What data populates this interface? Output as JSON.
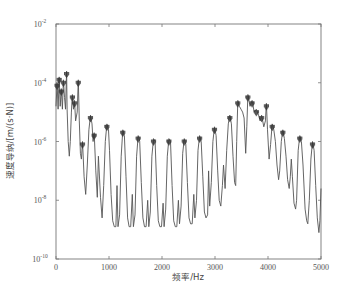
{
  "chart_data": {
    "type": "line",
    "title": "",
    "xlabel": "频率/Hz",
    "ylabel": "速度导纳/[m/(s·N)]",
    "xlim": [
      0,
      5000
    ],
    "ylim": [
      1e-10,
      0.01
    ],
    "yscale": "log",
    "grid": false,
    "legend": null,
    "x_ticks": [
      0,
      1000,
      2000,
      3000,
      4000,
      5000
    ],
    "x_tick_labels": [
      "0",
      "1000",
      "2000",
      "3000",
      "4000",
      "5000"
    ],
    "y_ticks": [
      1e-10,
      1e-08,
      1e-06,
      0.0001,
      0.01
    ],
    "y_tick_labels": [
      {
        "base": "10",
        "exp": "-10"
      },
      {
        "base": "10",
        "exp": "-8"
      },
      {
        "base": "10",
        "exp": "-6"
      },
      {
        "base": "10",
        "exp": "-4"
      },
      {
        "base": "10",
        "exp": "-2"
      }
    ],
    "series": [
      {
        "name": "velocity admittance",
        "color": "#555555",
        "log10_points": [
          [
            0,
            -4.8
          ],
          [
            20,
            -4.0
          ],
          [
            40,
            -4.9
          ],
          [
            60,
            -3.8
          ],
          [
            80,
            -4.8
          ],
          [
            100,
            -4.2
          ],
          [
            120,
            -4.9
          ],
          [
            140,
            -3.9
          ],
          [
            160,
            -4.5
          ],
          [
            180,
            -4.9
          ],
          [
            200,
            -3.6
          ],
          [
            210,
            -4.9
          ],
          [
            230,
            -6.0
          ],
          [
            250,
            -6.5
          ],
          [
            270,
            -6.0
          ],
          [
            290,
            -5.0
          ],
          [
            310,
            -4.4
          ],
          [
            330,
            -4.9
          ],
          [
            350,
            -4.6
          ],
          [
            370,
            -5.3
          ],
          [
            400,
            -5.0
          ],
          [
            420,
            -3.9
          ],
          [
            440,
            -5.3
          ],
          [
            460,
            -6.4
          ],
          [
            480,
            -6.6
          ],
          [
            500,
            -6.0
          ],
          [
            530,
            -7.2
          ],
          [
            560,
            -7.8
          ],
          [
            590,
            -6.8
          ],
          [
            620,
            -5.6
          ],
          [
            650,
            -5.1
          ],
          [
            680,
            -5.4
          ],
          [
            700,
            -6.0
          ],
          [
            720,
            -5.7
          ],
          [
            750,
            -7.0
          ],
          [
            780,
            -7.9
          ],
          [
            800,
            -6.5
          ],
          [
            840,
            -7.9
          ],
          [
            870,
            -8.6
          ],
          [
            900,
            -7.5
          ],
          [
            930,
            -6.0
          ],
          [
            960,
            -5.4
          ],
          [
            990,
            -5.6
          ],
          [
            1010,
            -6.3
          ],
          [
            1040,
            -7.8
          ],
          [
            1070,
            -8.7
          ],
          [
            1100,
            -8.9
          ],
          [
            1130,
            -8.9
          ],
          [
            1150,
            -7.5
          ],
          [
            1170,
            -8.9
          ],
          [
            1200,
            -8.5
          ],
          [
            1230,
            -6.5
          ],
          [
            1260,
            -5.6
          ],
          [
            1290,
            -5.8
          ],
          [
            1320,
            -7.2
          ],
          [
            1350,
            -8.6
          ],
          [
            1380,
            -8.9
          ],
          [
            1410,
            -8.9
          ],
          [
            1440,
            -7.8
          ],
          [
            1460,
            -8.9
          ],
          [
            1490,
            -8.5
          ],
          [
            1520,
            -6.5
          ],
          [
            1550,
            -5.8
          ],
          [
            1580,
            -6.0
          ],
          [
            1610,
            -7.4
          ],
          [
            1640,
            -8.6
          ],
          [
            1670,
            -8.9
          ],
          [
            1700,
            -8.9
          ],
          [
            1730,
            -8.0
          ],
          [
            1750,
            -8.9
          ],
          [
            1780,
            -8.4
          ],
          [
            1810,
            -6.5
          ],
          [
            1840,
            -5.9
          ],
          [
            1870,
            -6.0
          ],
          [
            1900,
            -7.5
          ],
          [
            1930,
            -8.7
          ],
          [
            1960,
            -8.9
          ],
          [
            1990,
            -8.9
          ],
          [
            2020,
            -8.1
          ],
          [
            2040,
            -8.9
          ],
          [
            2070,
            -8.3
          ],
          [
            2100,
            -6.5
          ],
          [
            2130,
            -5.9
          ],
          [
            2160,
            -6.0
          ],
          [
            2190,
            -7.5
          ],
          [
            2220,
            -8.7
          ],
          [
            2250,
            -8.9
          ],
          [
            2280,
            -8.9
          ],
          [
            2310,
            -8.0
          ],
          [
            2330,
            -8.8
          ],
          [
            2360,
            -8.2
          ],
          [
            2390,
            -6.4
          ],
          [
            2420,
            -5.9
          ],
          [
            2450,
            -6.1
          ],
          [
            2480,
            -7.4
          ],
          [
            2510,
            -8.6
          ],
          [
            2540,
            -8.8
          ],
          [
            2570,
            -8.8
          ],
          [
            2600,
            -7.8
          ],
          [
            2620,
            -8.6
          ],
          [
            2650,
            -8.0
          ],
          [
            2680,
            -6.3
          ],
          [
            2710,
            -5.8
          ],
          [
            2740,
            -6.0
          ],
          [
            2770,
            -7.2
          ],
          [
            2800,
            -8.4
          ],
          [
            2830,
            -8.6
          ],
          [
            2860,
            -8.5
          ],
          [
            2880,
            -7.0
          ],
          [
            2900,
            -8.2
          ],
          [
            2930,
            -7.4
          ],
          [
            2960,
            -6.0
          ],
          [
            2990,
            -5.5
          ],
          [
            3020,
            -5.8
          ],
          [
            3050,
            -7.0
          ],
          [
            3080,
            -8.0
          ],
          [
            3110,
            -8.2
          ],
          [
            3140,
            -7.5
          ],
          [
            3160,
            -6.8
          ],
          [
            3190,
            -7.6
          ],
          [
            3220,
            -6.3
          ],
          [
            3250,
            -5.4
          ],
          [
            3280,
            -5.1
          ],
          [
            3310,
            -5.4
          ],
          [
            3340,
            -6.5
          ],
          [
            3370,
            -7.4
          ],
          [
            3390,
            -7.5
          ],
          [
            3410,
            -6.0
          ],
          [
            3430,
            -4.6
          ],
          [
            3460,
            -4.8
          ],
          [
            3490,
            -4.9
          ],
          [
            3520,
            -5.0
          ],
          [
            3550,
            -5.2
          ],
          [
            3580,
            -6.4
          ],
          [
            3600,
            -5.5
          ],
          [
            3620,
            -4.4
          ],
          [
            3660,
            -4.8
          ],
          [
            3700,
            -4.6
          ],
          [
            3740,
            -5.0
          ],
          [
            3780,
            -4.9
          ],
          [
            3820,
            -5.1
          ],
          [
            3850,
            -5.3
          ],
          [
            3880,
            -5.1
          ],
          [
            3920,
            -5.5
          ],
          [
            3950,
            -5.3
          ],
          [
            3970,
            -4.7
          ],
          [
            3990,
            -5.6
          ],
          [
            4020,
            -6.6
          ],
          [
            4050,
            -6.1
          ],
          [
            4080,
            -5.4
          ],
          [
            4110,
            -5.6
          ],
          [
            4140,
            -6.0
          ],
          [
            4170,
            -6.8
          ],
          [
            4200,
            -7.3
          ],
          [
            4220,
            -7.0
          ],
          [
            4250,
            -6.0
          ],
          [
            4280,
            -5.6
          ],
          [
            4310,
            -5.9
          ],
          [
            4340,
            -6.5
          ],
          [
            4370,
            -7.3
          ],
          [
            4400,
            -7.6
          ],
          [
            4420,
            -7.2
          ],
          [
            4440,
            -6.6
          ],
          [
            4460,
            -7.2
          ],
          [
            4490,
            -8.1
          ],
          [
            4520,
            -8.3
          ],
          [
            4540,
            -8.0
          ],
          [
            4570,
            -6.3
          ],
          [
            4600,
            -5.8
          ],
          [
            4630,
            -6.0
          ],
          [
            4660,
            -6.8
          ],
          [
            4700,
            -8.3
          ],
          [
            4730,
            -8.7
          ],
          [
            4750,
            -8.8
          ],
          [
            4780,
            -8.0
          ],
          [
            4810,
            -6.6
          ],
          [
            4840,
            -6.0
          ],
          [
            4870,
            -6.3
          ],
          [
            4900,
            -7.5
          ],
          [
            4930,
            -8.6
          ],
          [
            4960,
            -9.1
          ],
          [
            4980,
            -8.7
          ],
          [
            5000,
            -7.6
          ]
        ]
      }
    ]
  }
}
